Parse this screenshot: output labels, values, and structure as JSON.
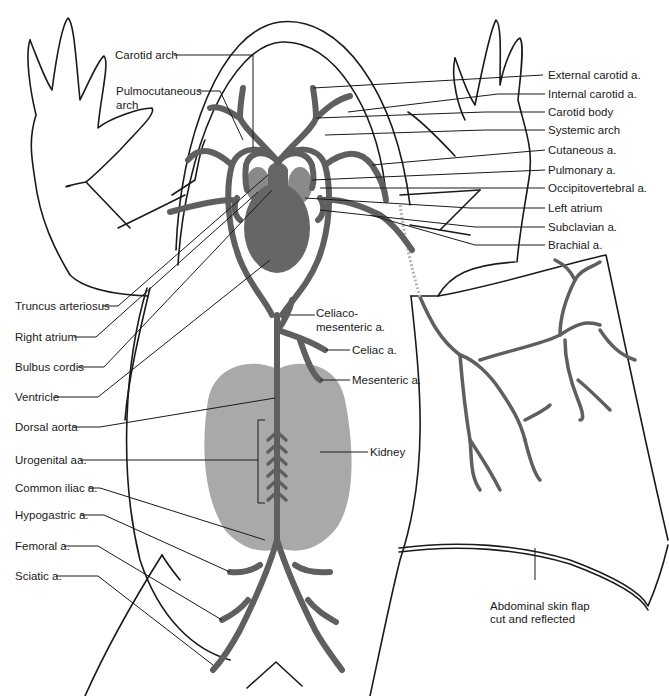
{
  "figure": {
    "colors": {
      "vessel": "#5f5f5f",
      "ventricle": "#666666",
      "atrium": "#8a8a8a",
      "kidney": "#a9a9a9",
      "outline": "#1a1a1a",
      "background": "#ffffff"
    }
  },
  "labels": {
    "left": [
      {
        "id": "carotid-arch",
        "text": "Carotid arch"
      },
      {
        "id": "pulmocutaneous-arch",
        "lines": [
          "Pulmocutaneous",
          "arch"
        ]
      },
      {
        "id": "truncus-arteriosus",
        "text": "Truncus arteriosus"
      },
      {
        "id": "right-atrium",
        "text": "Right atrium"
      },
      {
        "id": "bulbus-cordis",
        "text": "Bulbus cordis"
      },
      {
        "id": "ventricle",
        "text": "Ventricle"
      },
      {
        "id": "dorsal-aorta",
        "text": "Dorsal aorta"
      },
      {
        "id": "urogenital-aa",
        "text": "Urogenital aa."
      },
      {
        "id": "common-iliac-a",
        "text": "Common iliac a."
      },
      {
        "id": "hypogastric-a",
        "text": "Hypogastric a."
      },
      {
        "id": "femoral-a",
        "text": "Femoral a."
      },
      {
        "id": "sciatic-a",
        "text": "Sciatic a."
      }
    ],
    "right": [
      {
        "id": "external-carotid-a",
        "text": "External carotid a."
      },
      {
        "id": "internal-carotid-a",
        "text": "Internal carotid a."
      },
      {
        "id": "carotid-body",
        "text": "Carotid body"
      },
      {
        "id": "systemic-arch",
        "text": "Systemic arch"
      },
      {
        "id": "cutaneous-a",
        "text": "Cutaneous a."
      },
      {
        "id": "pulmonary-a",
        "text": "Pulmonary a."
      },
      {
        "id": "occipitovertebral-a",
        "text": "Occipitovertebral a."
      },
      {
        "id": "left-atrium",
        "text": "Left atrium"
      },
      {
        "id": "subclavian-a",
        "text": "Subclavian a."
      },
      {
        "id": "brachial-a",
        "text": "Brachial a."
      }
    ],
    "center": [
      {
        "id": "celiacomesenteric-a",
        "lines": [
          "Celiaco-",
          "mesenteric a."
        ]
      },
      {
        "id": "celiac-a",
        "text": "Celiac a."
      },
      {
        "id": "mesenteric-a",
        "text": "Mesenteric a."
      },
      {
        "id": "kidney",
        "text": "Kidney"
      },
      {
        "id": "abdominal-skin-flap",
        "lines": [
          "Abdominal skin flap",
          "cut and reflected"
        ]
      }
    ]
  }
}
